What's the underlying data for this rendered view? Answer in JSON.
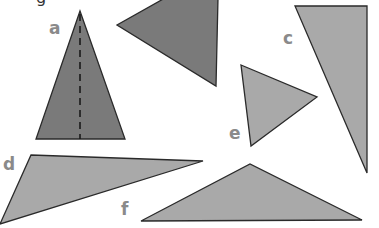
{
  "heading_fragment": "g",
  "colors": {
    "dark_fill": "#7a7a7a",
    "light_fill": "#a9a9a9",
    "outline": "#2a2a2a",
    "label": "#8a8a8a",
    "background": "#ffffff"
  },
  "shapes": [
    {
      "id": "a",
      "label": "a",
      "label_pos": [
        55,
        34
      ],
      "points": "80,11 36,139 125,139",
      "fill": "dark",
      "axis_of_symmetry": {
        "x1": 80,
        "y1": 14,
        "x2": 80,
        "y2": 139
      }
    },
    {
      "id": "b",
      "label": "",
      "points": "165,-2 218,-2 216,86 117,25",
      "fill": "dark"
    },
    {
      "id": "c",
      "label": "c",
      "label_pos": [
        285,
        44
      ],
      "points": "295,6 367,6 367,173",
      "fill": "light"
    },
    {
      "id": "d",
      "label": "d",
      "label_pos": [
        4,
        170
      ],
      "points": "31,155 203,161 0,224",
      "fill": "light"
    },
    {
      "id": "e",
      "label": "e",
      "label_pos": [
        230,
        139
      ],
      "points": "241,65 317,97 251,146",
      "fill": "light"
    },
    {
      "id": "f",
      "label": "f",
      "label_pos": [
        121,
        215
      ],
      "points": "141,221 250,164 362,220",
      "fill": "light"
    }
  ]
}
